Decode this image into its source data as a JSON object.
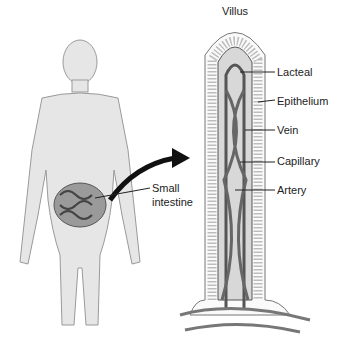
{
  "diagram": {
    "title": "Villus",
    "labels": {
      "lacteal": "Lacteal",
      "epithelium": "Epithelium",
      "vein": "Vein",
      "capillary": "Capillary",
      "artery": "Artery",
      "small_intestine_line1": "Small",
      "small_intestine_line2": "intestine"
    },
    "colors": {
      "body_fill": "#e6e6e6",
      "body_stroke": "#9a9a9a",
      "intestine": "#7a7a7a",
      "vessel": "#555555",
      "epithelium_stripe": "#bdbdbd"
    }
  }
}
